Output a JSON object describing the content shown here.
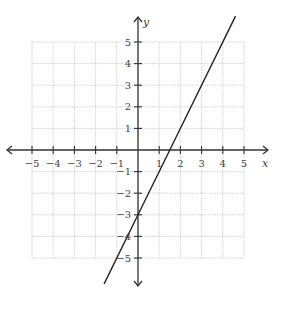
{
  "chart_data": {
    "type": "line",
    "title": "",
    "xlabel": "x",
    "ylabel": "y",
    "xlim": [
      -5,
      5
    ],
    "ylim": [
      -5,
      5
    ],
    "grid": true,
    "x_ticks": [
      -5,
      -4,
      -3,
      -2,
      -1,
      1,
      2,
      3,
      4,
      5
    ],
    "y_ticks": [
      -5,
      -4,
      -3,
      -2,
      -1,
      1,
      2,
      3,
      4,
      5
    ],
    "x_tick_labels": [
      "−5",
      "−4",
      "−3",
      "−2",
      "−1",
      "1",
      "2",
      "3",
      "4",
      "5"
    ],
    "y_tick_labels": [
      "−5",
      "−4",
      "−3",
      "−2",
      "−1",
      "1",
      "2",
      "3",
      "4",
      "5"
    ],
    "series": [
      {
        "name": "y = 2x - 3",
        "slope": 2,
        "intercept": -3,
        "x": [
          -1.6,
          0,
          1.5,
          4.6
        ],
        "y": [
          -6.2,
          -3,
          0,
          6.2
        ]
      }
    ],
    "axes_arrows": true,
    "legend": null
  },
  "colors": {
    "grid": "#c8c8c8",
    "axis": "#333333",
    "line": "#222222",
    "text": "#444444"
  },
  "labels": {
    "x_axis": "x",
    "y_axis": "y"
  }
}
